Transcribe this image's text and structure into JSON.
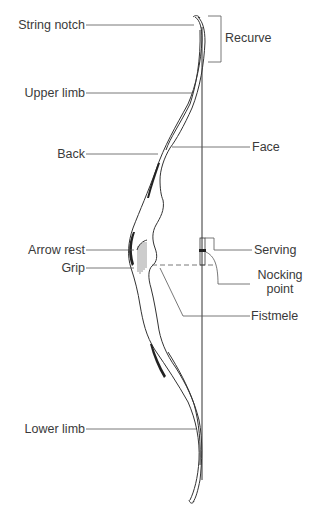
{
  "diagram": {
    "stroke_color": "#333333",
    "fill_color": "#222222",
    "labels": {
      "string_notch": "String notch",
      "recurve": "Recurve",
      "upper_limb": "Upper limb",
      "back": "Back",
      "face": "Face",
      "arrow_rest": "Arrow rest",
      "grip": "Grip",
      "serving": "Serving",
      "nocking_point_line1": "Nocking",
      "nocking_point_line2": "point",
      "fistmele": "Fistmele",
      "lower_limb": "Lower limb"
    }
  }
}
